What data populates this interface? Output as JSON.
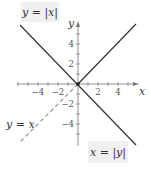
{
  "figure": {
    "labels": {
      "top_left": {
        "lhs": "y",
        "eq": " = ",
        "rhs": "|x|"
      },
      "bottom_right": {
        "lhs": "x",
        "eq": " = ",
        "rhs": "|y|"
      },
      "dashed": {
        "lhs": "y",
        "eq": " = ",
        "rhs": "x"
      }
    },
    "axes": {
      "x_name": "x",
      "y_name": "y",
      "x_tick_labels": [
        "−4",
        "−2",
        "2",
        "4"
      ],
      "y_tick_labels": [
        "4",
        "2",
        "−2",
        "−4"
      ]
    },
    "colors": {
      "line": "#333333",
      "dashed": "#888888",
      "axis": "#777777",
      "label_bg": "#f0f0f0"
    }
  }
}
